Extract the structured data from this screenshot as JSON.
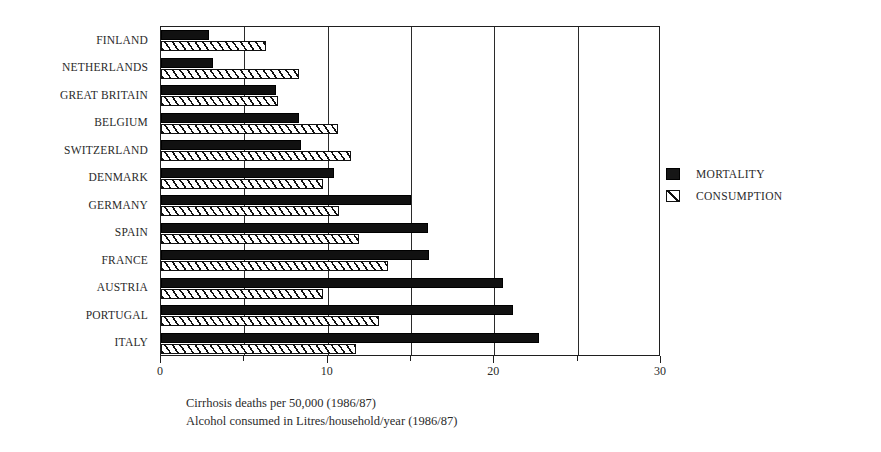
{
  "chart_data": {
    "type": "bar",
    "orientation": "horizontal",
    "title": "",
    "xlabel": "",
    "ylabel": "",
    "xlim": [
      0,
      30
    ],
    "grid": true,
    "legend_position": "right",
    "categories": [
      "FINLAND",
      "NETHERLANDS",
      "GREAT BRITAIN",
      "BELGIUM",
      "SWITZERLAND",
      "DENMARK",
      "GERMANY",
      "SPAIN",
      "FRANCE",
      "AUSTRIA",
      "PORTUGAL",
      "ITALY"
    ],
    "series": [
      {
        "name": "MORTALITY",
        "color": "#111111",
        "fill": "solid",
        "values": [
          2.9,
          3.1,
          6.9,
          8.3,
          8.4,
          10.4,
          15.0,
          16.0,
          16.1,
          20.5,
          21.1,
          22.7
        ]
      },
      {
        "name": "CONSUMPTION",
        "color": "#111111",
        "fill": "hatched",
        "values": [
          6.3,
          8.3,
          7.0,
          10.6,
          11.4,
          9.7,
          10.7,
          11.9,
          13.6,
          9.7,
          13.1,
          11.7
        ]
      }
    ],
    "xticks": [
      0,
      5,
      10,
      15,
      20,
      25,
      30
    ],
    "xtick_labels": [
      "0",
      "",
      "10",
      "",
      "20",
      "",
      "30"
    ],
    "annotations": [
      "Cirrhosis deaths per 50,000  (1986/87)",
      "Alcohol consumed in Litres/household/year (1986/87)"
    ]
  },
  "legend": {
    "items": [
      {
        "label": "MORTALITY",
        "swatch": "solid-square-icon"
      },
      {
        "label": "CONSUMPTION",
        "swatch": "hatched-square-icon"
      }
    ]
  },
  "caption": {
    "line1": "Cirrhosis deaths per 50,000  (1986/87)",
    "line2": "Alcohol consumed in Litres/household/year (1986/87)"
  }
}
